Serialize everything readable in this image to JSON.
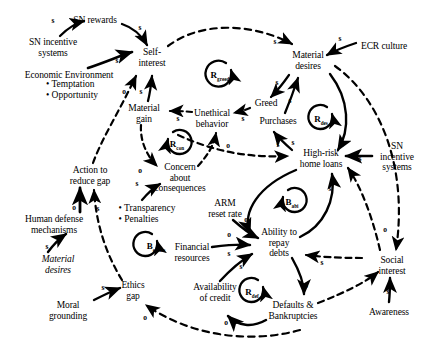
{
  "diagram": {
    "type": "causal-loop-diagram",
    "width": 432,
    "height": 358,
    "background": "#ffffff",
    "stroke": "#000000"
  },
  "nodes": [
    {
      "id": "sn_rewards",
      "label": "SN rewards",
      "x": 95,
      "y": 20,
      "align": "center",
      "italic": false
    },
    {
      "id": "sn_incentive_l",
      "label": "SN incentive\nsystems",
      "x": 53,
      "y": 47,
      "align": "center",
      "italic": false
    },
    {
      "id": "econ_env",
      "label": "Economic Environment",
      "x": 69,
      "y": 75,
      "align": "center",
      "italic": false
    },
    {
      "id": "self_interest",
      "label": "Self-\ninterest",
      "x": 152,
      "y": 57,
      "align": "center",
      "italic": false
    },
    {
      "id": "material_desires",
      "label": "Material\ndesires",
      "x": 308,
      "y": 60,
      "align": "center",
      "italic": false
    },
    {
      "id": "ecr_culture",
      "label": "ECR culture",
      "x": 384,
      "y": 46,
      "align": "center",
      "italic": false
    },
    {
      "id": "greed",
      "label": "Greed",
      "x": 266,
      "y": 103,
      "align": "center",
      "italic": false
    },
    {
      "id": "purchases",
      "label": "Purchases",
      "x": 278,
      "y": 121,
      "align": "center",
      "italic": false
    },
    {
      "id": "material_gain",
      "label": "Material\ngain",
      "x": 144,
      "y": 113,
      "align": "center",
      "italic": false
    },
    {
      "id": "unethical",
      "label": "Unethical\nbehavior",
      "x": 212,
      "y": 118,
      "align": "center",
      "italic": false
    },
    {
      "id": "highrisk",
      "label": "High-risk\nhome loans",
      "x": 321,
      "y": 158,
      "align": "center",
      "italic": false
    },
    {
      "id": "sn_incentive_r",
      "label": "SN\nincentive\nsystems",
      "x": 397,
      "y": 157,
      "align": "center",
      "italic": false
    },
    {
      "id": "concern",
      "label": "Concern\nabout\nconsequences",
      "x": 180,
      "y": 178,
      "align": "center",
      "italic": false
    },
    {
      "id": "action_gap",
      "label": "Action to\nreduce gap",
      "x": 90,
      "y": 175,
      "align": "center",
      "italic": false
    },
    {
      "id": "transparency",
      "label": "Transparency",
      "x": 142,
      "y": 209,
      "align": "left",
      "italic": false
    },
    {
      "id": "arm_reset",
      "label": "ARM\nreset rate",
      "x": 225,
      "y": 208,
      "align": "center",
      "italic": false
    },
    {
      "id": "human_defense",
      "label": "Human defense\nmechanisms",
      "x": 54,
      "y": 224,
      "align": "center",
      "italic": false
    },
    {
      "id": "ability_repay",
      "label": "Ability to\nrepay\ndebts",
      "x": 279,
      "y": 243,
      "align": "center",
      "italic": false
    },
    {
      "id": "financial_res",
      "label": "Financial\nresources",
      "x": 192,
      "y": 252,
      "align": "center",
      "italic": false
    },
    {
      "id": "material_desires2",
      "label": "Material\ndesires",
      "x": 58,
      "y": 264,
      "align": "center",
      "italic": true
    },
    {
      "id": "availability",
      "label": "Availability\nof credit",
      "x": 215,
      "y": 292,
      "align": "center",
      "italic": false
    },
    {
      "id": "defaults",
      "label": "Defaults &\nBankruptcies",
      "x": 293,
      "y": 310,
      "align": "center",
      "italic": false
    },
    {
      "id": "ethics_gap",
      "label": "Ethics\ngap",
      "x": 133,
      "y": 290,
      "align": "center",
      "italic": false
    },
    {
      "id": "moral_ground",
      "label": "Moral\ngrounding",
      "x": 68,
      "y": 310,
      "align": "center",
      "italic": false
    },
    {
      "id": "social_interest",
      "label": "Social\ninterest",
      "x": 392,
      "y": 265,
      "align": "center",
      "italic": false
    },
    {
      "id": "awareness",
      "label": "Awareness",
      "x": 389,
      "y": 312,
      "align": "center",
      "italic": false
    }
  ],
  "bullet_lists": [
    {
      "id": "econ_env_bullets",
      "x": 72,
      "y": 89,
      "items": [
        "• Temptation",
        "• Opportunity"
      ]
    },
    {
      "id": "transparency_bullets",
      "x": 147,
      "y": 213,
      "items": [
        "• Transparency",
        "• Penalties"
      ]
    }
  ],
  "loops": [
    {
      "id": "r_greed",
      "base": "R",
      "sub": "greed",
      "x": 220,
      "y": 74,
      "radius": 13,
      "polarity": "reinforcing"
    },
    {
      "id": "r_des",
      "base": "R",
      "sub": "des",
      "x": 322,
      "y": 118,
      "radius": 12,
      "polarity": "reinforcing"
    },
    {
      "id": "r_con",
      "base": "R",
      "sub": "con",
      "x": 178,
      "y": 143,
      "radius": 12,
      "polarity": "reinforcing"
    },
    {
      "id": "b_abi",
      "base": "B",
      "sub": "abi",
      "x": 293,
      "y": 201,
      "radius": 12,
      "polarity": "balancing"
    },
    {
      "id": "b_ethics",
      "base": "B",
      "sub": "ethics",
      "x": 157,
      "y": 245,
      "radius": 12,
      "polarity": "balancing"
    },
    {
      "id": "r_def",
      "base": "R",
      "sub": "def",
      "x": 253,
      "y": 291,
      "radius": 12,
      "polarity": "reinforcing"
    }
  ],
  "link_labels": [
    {
      "id": "l1",
      "text": "s",
      "x": 53,
      "y": 20
    },
    {
      "id": "l2",
      "text": "s",
      "x": 140,
      "y": 27
    },
    {
      "id": "l3",
      "text": "s",
      "x": 117,
      "y": 60
    },
    {
      "id": "l4",
      "text": "o",
      "x": 124,
      "y": 91
    },
    {
      "id": "l5",
      "text": "s",
      "x": 141,
      "y": 91
    },
    {
      "id": "l6",
      "text": "s",
      "x": 275,
      "y": 41
    },
    {
      "id": "l7",
      "text": "s",
      "x": 340,
      "y": 38
    },
    {
      "id": "l8",
      "text": "s",
      "x": 277,
      "y": 82
    },
    {
      "id": "l9",
      "text": "s",
      "x": 290,
      "y": 100
    },
    {
      "id": "l10",
      "text": "s",
      "x": 178,
      "y": 118
    },
    {
      "id": "l11",
      "text": "s",
      "x": 243,
      "y": 118
    },
    {
      "id": "l12",
      "text": "s",
      "x": 293,
      "y": 142
    },
    {
      "id": "l13",
      "text": "s",
      "x": 278,
      "y": 144
    },
    {
      "id": "l14",
      "text": "s",
      "x": 342,
      "y": 144
    },
    {
      "id": "l15",
      "text": "s",
      "x": 360,
      "y": 158
    },
    {
      "id": "l16",
      "text": "o",
      "x": 351,
      "y": 171
    },
    {
      "id": "l17",
      "text": "o",
      "x": 228,
      "y": 145
    },
    {
      "id": "l18",
      "text": "o",
      "x": 140,
      "y": 170
    },
    {
      "id": "l19",
      "text": "s",
      "x": 137,
      "y": 183
    },
    {
      "id": "l20",
      "text": "o",
      "x": 74,
      "y": 207
    },
    {
      "id": "l21",
      "text": "s",
      "x": 98,
      "y": 208
    },
    {
      "id": "l22",
      "text": "s",
      "x": 47,
      "y": 246
    },
    {
      "id": "l23",
      "text": "s",
      "x": 103,
      "y": 287
    },
    {
      "id": "l24",
      "text": "o",
      "x": 145,
      "y": 317
    },
    {
      "id": "l25",
      "text": "o",
      "x": 246,
      "y": 219
    },
    {
      "id": "l26",
      "text": "o",
      "x": 229,
      "y": 234
    },
    {
      "id": "l27",
      "text": "s",
      "x": 229,
      "y": 253
    },
    {
      "id": "l28",
      "text": "s",
      "x": 241,
      "y": 266
    },
    {
      "id": "l29",
      "text": "s",
      "x": 330,
      "y": 188
    },
    {
      "id": "l30",
      "text": "s",
      "x": 322,
      "y": 262
    },
    {
      "id": "l31",
      "text": "o",
      "x": 306,
      "y": 285
    },
    {
      "id": "l32",
      "text": "o",
      "x": 226,
      "y": 322
    },
    {
      "id": "l33",
      "text": "o",
      "x": 385,
      "y": 229
    },
    {
      "id": "l34",
      "text": "s",
      "x": 388,
      "y": 291
    }
  ],
  "edges": [
    {
      "from": "sn_incentive_l",
      "to": "sn_rewards",
      "polarity": "s",
      "style": "solid"
    },
    {
      "from": "sn_rewards",
      "to": "self_interest",
      "polarity": "s",
      "style": "solid"
    },
    {
      "from": "sn_incentive_l",
      "to": "self_interest",
      "polarity": "s",
      "style": "solid"
    },
    {
      "from": "action_gap",
      "to": "self_interest",
      "polarity": "o",
      "style": "dashed"
    },
    {
      "from": "material_gain",
      "to": "self_interest",
      "polarity": "s",
      "style": "solid"
    },
    {
      "from": "self_interest",
      "to": "material_desires",
      "polarity": "s",
      "style": "dashed"
    },
    {
      "from": "ecr_culture",
      "to": "material_desires",
      "polarity": "s",
      "style": "solid"
    },
    {
      "from": "material_desires",
      "to": "greed",
      "polarity": "s",
      "style": "solid"
    },
    {
      "from": "purchases",
      "to": "material_desires",
      "polarity": "s",
      "style": "solid"
    },
    {
      "from": "greed",
      "to": "unethical",
      "polarity": "s",
      "style": "dashed"
    },
    {
      "from": "unethical",
      "to": "material_gain",
      "polarity": "s",
      "style": "dashed"
    },
    {
      "from": "unethical",
      "to": "highrisk",
      "polarity": "s",
      "style": "dashed"
    },
    {
      "from": "highrisk",
      "to": "purchases",
      "polarity": "s",
      "style": "solid"
    },
    {
      "from": "material_desires",
      "to": "highrisk",
      "polarity": "s",
      "style": "solid"
    },
    {
      "from": "sn_incentive_r",
      "to": "highrisk",
      "polarity": "s",
      "style": "solid"
    },
    {
      "from": "social_interest",
      "to": "highrisk",
      "polarity": "o",
      "style": "dashed"
    },
    {
      "from": "concern",
      "to": "unethical",
      "polarity": "o",
      "style": "dashed"
    },
    {
      "from": "material_gain",
      "to": "concern",
      "polarity": "o",
      "style": "dashed"
    },
    {
      "from": "transparency",
      "to": "concern",
      "polarity": "s",
      "style": "solid"
    },
    {
      "from": "human_defense",
      "to": "action_gap",
      "polarity": "o",
      "style": "solid"
    },
    {
      "from": "ethics_gap",
      "to": "action_gap",
      "polarity": "s",
      "style": "dashed"
    },
    {
      "from": "material_desires2",
      "to": "human_defense",
      "polarity": "s",
      "style": "solid"
    },
    {
      "from": "moral_ground",
      "to": "ethics_gap",
      "polarity": "s",
      "style": "solid"
    },
    {
      "from": "defaults",
      "to": "ethics_gap",
      "polarity": "o",
      "style": "dashed"
    },
    {
      "from": "arm_reset",
      "to": "ability_repay",
      "polarity": "o",
      "style": "solid"
    },
    {
      "from": "highrisk",
      "to": "ability_repay",
      "polarity": "o",
      "style": "solid"
    },
    {
      "from": "financial_res",
      "to": "ability_repay",
      "polarity": "s",
      "style": "solid"
    },
    {
      "from": "availability",
      "to": "ability_repay",
      "polarity": "s",
      "style": "solid"
    },
    {
      "from": "ability_repay",
      "to": "highrisk",
      "polarity": "s",
      "style": "solid"
    },
    {
      "from": "social_interest",
      "to": "ability_repay",
      "polarity": "s",
      "style": "dashed"
    },
    {
      "from": "ability_repay",
      "to": "defaults",
      "polarity": "o",
      "style": "solid"
    },
    {
      "from": "defaults",
      "to": "availability",
      "polarity": "o",
      "style": "solid"
    },
    {
      "from": "defaults",
      "to": "social_interest",
      "polarity": "s",
      "style": "dashed"
    },
    {
      "from": "awareness",
      "to": "social_interest",
      "polarity": "s",
      "style": "solid"
    },
    {
      "from": "material_desires",
      "to": "social_interest",
      "polarity": "o",
      "style": "dashed"
    }
  ]
}
